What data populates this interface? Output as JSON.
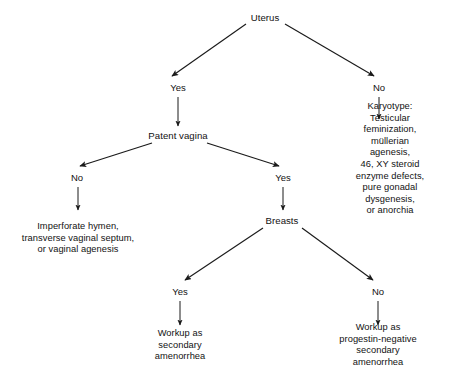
{
  "diagram": {
    "type": "flowchart",
    "background_color": "#ffffff",
    "line_color": "#1a1a1a",
    "text_color": "#121212",
    "nodes": [
      {
        "id": "uterus",
        "label": "Uterus",
        "kind": "decision",
        "x": 265,
        "y": 18
      },
      {
        "id": "uterus-yes",
        "label": "Yes",
        "kind": "branch",
        "x": 178,
        "y": 88
      },
      {
        "id": "uterus-no",
        "label": "No",
        "kind": "branch",
        "x": 379,
        "y": 88
      },
      {
        "id": "patent-vagina",
        "label": "Patent vagina",
        "kind": "decision",
        "x": 178,
        "y": 136
      },
      {
        "id": "karyotype",
        "label": "Karyotype:\nTesticular feminization,\nmüllerian agenesis,\n46, XY steroid enzyme defects,\npure gonadal dysgenesis,\nor anorchia",
        "kind": "leaf",
        "x": 390,
        "y": 159
      },
      {
        "id": "vagina-no",
        "label": "No",
        "kind": "branch",
        "x": 77,
        "y": 178
      },
      {
        "id": "vagina-yes",
        "label": "Yes",
        "kind": "branch",
        "x": 283,
        "y": 178
      },
      {
        "id": "imperforate-hymen",
        "label": "Imperforate hymen,\ntransverse vaginal septum,\nor vaginal agenesis",
        "kind": "leaf",
        "x": 78,
        "y": 238
      },
      {
        "id": "breasts",
        "label": "Breasts",
        "kind": "decision",
        "x": 282,
        "y": 221
      },
      {
        "id": "breasts-yes",
        "label": "Yes",
        "kind": "branch",
        "x": 180,
        "y": 292
      },
      {
        "id": "breasts-no",
        "label": "No",
        "kind": "branch",
        "x": 378,
        "y": 292
      },
      {
        "id": "workup-secondary",
        "label": "Workup as\nsecondary\namenorrhea",
        "kind": "leaf",
        "x": 180,
        "y": 345
      },
      {
        "id": "workup-progestin-negative",
        "label": "Workup as\nprogestin-negative\nsecondary amenorrhea",
        "kind": "leaf",
        "x": 378,
        "y": 345
      }
    ],
    "edges": [
      {
        "id": "uterus-to-yes",
        "from": "uterus",
        "to": "uterus-yes",
        "style": "diagonal-arrow"
      },
      {
        "id": "uterus-to-no",
        "from": "uterus",
        "to": "uterus-no",
        "style": "diagonal-arrow"
      },
      {
        "id": "yes-to-patent-vagina",
        "from": "uterus-yes",
        "to": "patent-vagina",
        "style": "vertical-arrow"
      },
      {
        "id": "no-to-karyotype",
        "from": "uterus-no",
        "to": "karyotype",
        "style": "vertical-arrow"
      },
      {
        "id": "patent-vagina-to-no",
        "from": "patent-vagina",
        "to": "vagina-no",
        "style": "diagonal-arrow"
      },
      {
        "id": "patent-vagina-to-yes",
        "from": "patent-vagina",
        "to": "vagina-yes",
        "style": "diagonal-arrow"
      },
      {
        "id": "vagina-no-to-imperforate",
        "from": "vagina-no",
        "to": "imperforate-hymen",
        "style": "vertical-arrow"
      },
      {
        "id": "vagina-yes-to-breasts",
        "from": "vagina-yes",
        "to": "breasts",
        "style": "vertical-arrow"
      },
      {
        "id": "breasts-to-yes",
        "from": "breasts",
        "to": "breasts-yes",
        "style": "diagonal-arrow"
      },
      {
        "id": "breasts-to-no",
        "from": "breasts",
        "to": "breasts-no",
        "style": "diagonal-arrow"
      },
      {
        "id": "breasts-yes-to-workup",
        "from": "breasts-yes",
        "to": "workup-secondary",
        "style": "vertical-arrow"
      },
      {
        "id": "breasts-no-to-workup",
        "from": "breasts-no",
        "to": "workup-progestin-negative",
        "style": "vertical-arrow"
      }
    ],
    "edge_geometry": [
      {
        "id": "uterus-to-yes",
        "x1": 246,
        "y1": 24,
        "x2": 172,
        "y2": 76
      },
      {
        "id": "uterus-to-no",
        "x1": 285,
        "y1": 24,
        "x2": 374,
        "y2": 76
      },
      {
        "id": "yes-to-patent-vagina",
        "x1": 178,
        "y1": 97,
        "x2": 178,
        "y2": 126
      },
      {
        "id": "no-to-karyotype",
        "x1": 379,
        "y1": 97,
        "x2": 379,
        "y2": 119
      },
      {
        "id": "patent-vagina-to-no",
        "x1": 152,
        "y1": 143,
        "x2": 80,
        "y2": 166
      },
      {
        "id": "patent-vagina-to-yes",
        "x1": 207,
        "y1": 143,
        "x2": 279,
        "y2": 166
      },
      {
        "id": "vagina-no-to-imperforate",
        "x1": 78,
        "y1": 187,
        "x2": 78,
        "y2": 210
      },
      {
        "id": "vagina-yes-to-breasts",
        "x1": 283,
        "y1": 187,
        "x2": 283,
        "y2": 210
      },
      {
        "id": "breasts-to-yes",
        "x1": 263,
        "y1": 228,
        "x2": 185,
        "y2": 280
      },
      {
        "id": "breasts-to-no",
        "x1": 302,
        "y1": 228,
        "x2": 373,
        "y2": 280
      },
      {
        "id": "breasts-yes-to-workup",
        "x1": 180,
        "y1": 301,
        "x2": 180,
        "y2": 325
      },
      {
        "id": "breasts-no-to-workup",
        "x1": 378,
        "y1": 301,
        "x2": 378,
        "y2": 325
      }
    ]
  }
}
